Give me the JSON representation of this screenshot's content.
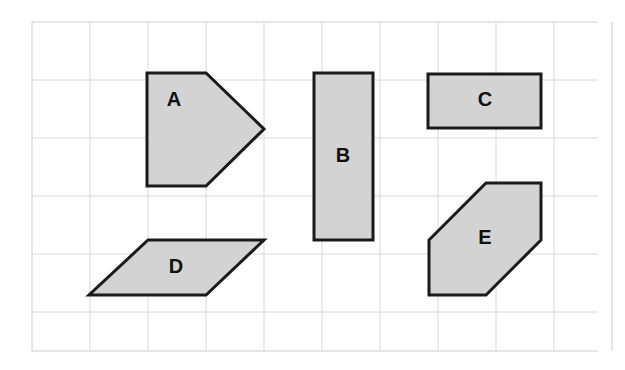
{
  "figure": {
    "background_color": "#ffffff",
    "grid": {
      "line_color": "#d8d8d8",
      "border_color": "#cccccc",
      "cell_size": 58,
      "origin_x": 32,
      "origin_y": 22,
      "columns": 10,
      "rows": 6,
      "width": 566,
      "height": 329
    },
    "style": {
      "shape_fill": "#d3d3d3",
      "shape_stroke": "#1a1a1a",
      "shape_stroke_width": 3,
      "label_color": "#111111",
      "label_font_size": 20
    },
    "shapes": [
      {
        "id": "shape-a",
        "label": "A",
        "type": "pentagon",
        "description": "right-pointing pentagon (arrow/home shape)",
        "points": "147,73 206,73 264,129 206,186 147,186",
        "label_x": 174,
        "label_y": 101
      },
      {
        "id": "shape-b",
        "label": "B",
        "type": "rectangle",
        "description": "tall vertical rectangle",
        "points": "314,73 373,73 373,240 314,240",
        "label_x": 343,
        "label_y": 157
      },
      {
        "id": "shape-c",
        "label": "C",
        "type": "rectangle",
        "description": "wide horizontal rectangle",
        "points": "428,74 541,74 541,128 428,128",
        "label_x": 485,
        "label_y": 101
      },
      {
        "id": "shape-d",
        "label": "D",
        "type": "parallelogram",
        "description": "slanted parallelogram leaning left",
        "points": "148,240 264,240 206,295 89,295",
        "label_x": 176,
        "label_y": 268
      },
      {
        "id": "shape-e",
        "label": "E",
        "type": "hexagon",
        "description": "hexagon with two cut corners",
        "points": "486,183 541,183 541,240 486,295 429,295 429,240",
        "label_x": 485,
        "label_y": 239
      }
    ]
  }
}
